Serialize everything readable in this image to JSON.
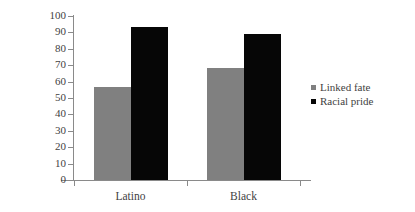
{
  "chart_data": {
    "type": "bar",
    "title": "",
    "xlabel": "",
    "ylabel": "Percentage",
    "categories": [
      "Latino",
      "Black"
    ],
    "series": [
      {
        "name": "Linked fate",
        "color": "#808080",
        "values": [
          57,
          68
        ]
      },
      {
        "name": "Racial pride",
        "color": "#060606",
        "values": [
          93,
          89
        ]
      }
    ],
    "ylim": [
      0,
      100
    ],
    "yticks": [
      0,
      10,
      20,
      30,
      40,
      50,
      60,
      70,
      80,
      90,
      100
    ],
    "ytick_labels": [
      "0",
      "10",
      "20",
      "30",
      "40",
      "50",
      "60",
      "70",
      "80",
      "90",
      "100"
    ],
    "grid": false,
    "legend_position": "right"
  },
  "axis": {
    "y_title": "Percentage"
  },
  "legend": {
    "items": [
      {
        "label": "Linked fate",
        "color": "#808080"
      },
      {
        "label": "Racial pride",
        "color": "#060606"
      }
    ]
  }
}
